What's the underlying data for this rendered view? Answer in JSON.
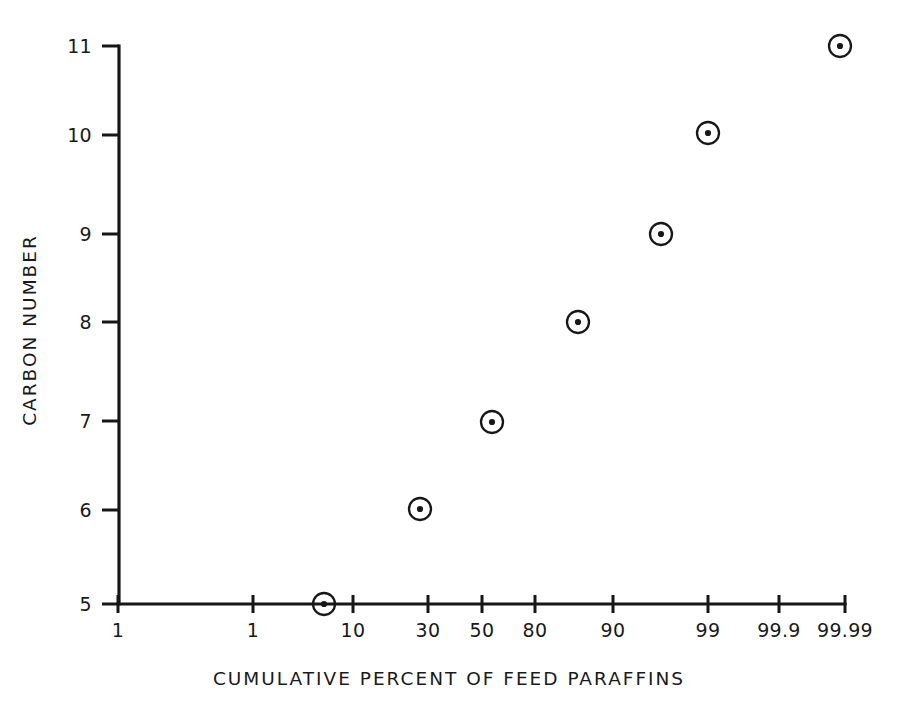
{
  "chart_data": {
    "type": "scatter",
    "title": "",
    "subtitle": "",
    "xlabel": "CUMULATIVE PERCENT OF FEED PARAFFINS",
    "ylabel": "CARBON NUMBER",
    "x_scale": "probability",
    "grid": false,
    "legend": null,
    "x_tick_labels": [
      "1",
      "1",
      "10",
      "30",
      "50",
      "80",
      "90",
      "99",
      "99.9",
      "99.99"
    ],
    "x_tick_positions_px": [
      118,
      253,
      353,
      428,
      482,
      535,
      613,
      708,
      779,
      845
    ],
    "y_tick_labels": [
      "5",
      "6",
      "7",
      "8",
      "9",
      "10",
      "11"
    ],
    "y_tick_values": [
      5,
      6,
      7,
      8,
      9,
      10,
      11
    ],
    "y_tick_positions_px": [
      604,
      510,
      421,
      322,
      234,
      135,
      46
    ],
    "ylim": [
      5,
      11
    ],
    "points": [
      {
        "label": "C5",
        "carbon_number": 5,
        "cumulative_percent": 5,
        "x_px": 324,
        "y_px": 604
      },
      {
        "label": "C6",
        "carbon_number": 6.05,
        "cumulative_percent": 27,
        "x_px": 420,
        "y_px": 509
      },
      {
        "label": "C7",
        "carbon_number": 7,
        "cumulative_percent": 52,
        "x_px": 492,
        "y_px": 422
      },
      {
        "label": "C8",
        "carbon_number": 8.07,
        "cumulative_percent": 85,
        "x_px": 578,
        "y_px": 322
      },
      {
        "label": "C9",
        "carbon_number": 9,
        "cumulative_percent": 95,
        "x_px": 661,
        "y_px": 234
      },
      {
        "label": "C10",
        "carbon_number": 10.1,
        "cumulative_percent": 99,
        "x_px": 708,
        "y_px": 133
      },
      {
        "label": "C11",
        "carbon_number": 11,
        "cumulative_percent": 99.99,
        "x_px": 840,
        "y_px": 46
      }
    ],
    "marker_style": {
      "shape": "circle-with-center-dot",
      "ring_radius_px": 11,
      "dot_radius_px": 3.1
    },
    "colors": {
      "ink": "#171717",
      "background": "#ffffff"
    }
  },
  "axes": {
    "y_axis_x_px": 119,
    "x_axis_y_px": 604,
    "x_axis_start_px": 118,
    "x_axis_end_px": 845,
    "y_axis_top_px": 46,
    "y_tick_length_px": 17,
    "x_tick_half_px": 9
  }
}
